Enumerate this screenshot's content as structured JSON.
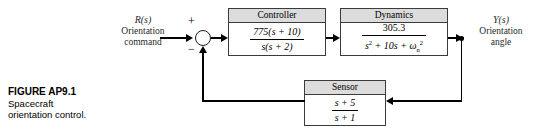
{
  "figure": {
    "number": "FIGURE AP9.1",
    "caption_line1": "Spacecraft",
    "caption_line2": "orientation control."
  },
  "input": {
    "symbol": "R(s)",
    "description_line1": "Orientation",
    "description_line2": "command"
  },
  "output": {
    "symbol": "Y(s)",
    "description_line1": "Orientation",
    "description_line2": "angle"
  },
  "summing_junction": {
    "positive_sign": "+",
    "negative_sign": "−"
  },
  "blocks": {
    "controller": {
      "title": "Controller",
      "numerator": "775(s + 10)",
      "denominator": "s(s + 2)"
    },
    "dynamics": {
      "title": "Dynamics",
      "numerator": "305.3",
      "denominator_pre": "s",
      "denominator_pre_sup": "2",
      "denominator_mid": " + 10s + ",
      "denominator_omega": "ω",
      "denominator_omega_sub": "n",
      "denominator_omega_sup": "2"
    },
    "sensor": {
      "title": "Sensor",
      "numerator": "s + 5",
      "denominator": "s + 1"
    }
  },
  "colors": {
    "line": "#000000",
    "block_border": "#3b3b3b",
    "block_header_fill": "#dcdcdc",
    "background": "#ffffff",
    "label_text": "#2a2a2a"
  }
}
